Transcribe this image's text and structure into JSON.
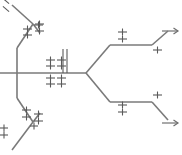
{
  "diagram": {
    "type": "phylogenetic-tree",
    "stroke_color": "#7a7a7a",
    "tick_color": "#5a5a5a",
    "background_color": "#ffffff",
    "width": 182,
    "height": 155,
    "branches": [
      {
        "id": "trunk-horizontal",
        "name": "central-horizontal-trunk",
        "points": "0,73 86,73"
      },
      {
        "id": "left-vertical",
        "name": "left-vertical-connector",
        "points": "17,48 17,98"
      },
      {
        "id": "upper-left-diagonal-in",
        "name": "upper-left-inner-diagonal",
        "points": "17,48 33,24"
      },
      {
        "id": "upper-left-node-upper",
        "name": "upper-left-node-upper-arm",
        "points": "33,24 12,5"
      },
      {
        "id": "upper-left-node-lower",
        "name": "upper-left-node-lower-arm",
        "points": "33,24 40,33"
      },
      {
        "id": "lower-left-diagonal-in",
        "name": "lower-left-inner-diagonal",
        "points": "17,98 33,122"
      },
      {
        "id": "lower-left-node-lower",
        "name": "lower-left-node-lower-arm",
        "points": "33,122 12,150"
      },
      {
        "id": "lower-left-node-upper",
        "name": "lower-left-node-upper-arm",
        "points": "33,122 40,113"
      },
      {
        "id": "right-fork-upper",
        "name": "right-fork-upper-diagonal",
        "points": "86,73 110,45"
      },
      {
        "id": "right-upper-horizontal",
        "name": "right-upper-horizontal",
        "points": "110,45 152,45"
      },
      {
        "id": "right-upper-tip",
        "name": "right-upper-terminal-diagonal",
        "points": "152,45 168,31"
      },
      {
        "id": "right-fork-lower",
        "name": "right-fork-lower-diagonal",
        "points": "86,73 110,102"
      },
      {
        "id": "right-lower-horizontal",
        "name": "right-lower-horizontal",
        "points": "110,102 152,102"
      },
      {
        "id": "right-lower-tip",
        "name": "right-lower-terminal-diagonal",
        "points": "152,102 168,120"
      }
    ],
    "arrows": [
      {
        "id": "arrow-upper-right",
        "name": "upper-right-arrow",
        "x1": 162,
        "y1": 31,
        "x2": 178,
        "y2": 31
      },
      {
        "id": "arrow-lower-right",
        "name": "lower-right-arrow",
        "x1": 162,
        "y1": 123,
        "x2": 178,
        "y2": 123
      }
    ],
    "tick_groups": [
      {
        "id": "ticks-top-left-edge",
        "name": "tick-group-top-left-edge",
        "label": "+",
        "count": 2,
        "ticks": [
          {
            "x": 2,
            "y": 1,
            "angle": 40,
            "len": 8
          },
          {
            "x": 2,
            "y": 9,
            "angle": 40,
            "len": 8
          }
        ]
      },
      {
        "id": "ticks-upper-left-node",
        "name": "tick-group-upper-left-node",
        "label": "+ +",
        "count": 3,
        "ticks": [
          {
            "x": 23,
            "y": 29,
            "angle": 0,
            "len": 9
          },
          {
            "x": 23,
            "y": 35,
            "angle": 0,
            "len": 9
          },
          {
            "x": 34,
            "y": 25,
            "angle": 0,
            "len": 9
          }
        ]
      },
      {
        "id": "ticks-upper-left-outer",
        "name": "tick-group-upper-left-outer",
        "label": "‡",
        "count": 2,
        "ticks": [
          {
            "x": 35,
            "y": 24,
            "angle": 0,
            "len": 9
          },
          {
            "x": 35,
            "y": 31,
            "angle": 0,
            "len": 9
          }
        ]
      },
      {
        "id": "ticks-center-upper-left",
        "name": "tick-group-center-upper-left",
        "label": "‡",
        "count": 2,
        "ticks": [
          {
            "x": 46,
            "y": 60,
            "angle": 0,
            "len": 9
          },
          {
            "x": 46,
            "y": 66,
            "angle": 0,
            "len": 9
          }
        ]
      },
      {
        "id": "ticks-center-upper-right",
        "name": "tick-group-center-upper-right",
        "label": "‡",
        "count": 2,
        "ticks": [
          {
            "x": 57,
            "y": 60,
            "angle": 0,
            "len": 9
          },
          {
            "x": 57,
            "y": 66,
            "angle": 0,
            "len": 9
          }
        ]
      },
      {
        "id": "ticks-center-lower-left",
        "name": "tick-group-center-lower-left",
        "label": "‡",
        "count": 2,
        "ticks": [
          {
            "x": 46,
            "y": 78,
            "angle": 0,
            "len": 9
          },
          {
            "x": 46,
            "y": 84,
            "angle": 0,
            "len": 9
          }
        ]
      },
      {
        "id": "ticks-center-lower-right",
        "name": "tick-group-center-lower-right",
        "label": "‡",
        "count": 2,
        "ticks": [
          {
            "x": 57,
            "y": 78,
            "angle": 0,
            "len": 9
          },
          {
            "x": 57,
            "y": 84,
            "angle": 0,
            "len": 9
          }
        ]
      },
      {
        "id": "ticks-center-vertical-bars",
        "name": "tick-group-center-vertical-bars",
        "label": "vertical-hatch",
        "count": 2,
        "ticks": [
          {
            "x": 51,
            "y": 61,
            "angle": 90,
            "len": 24
          },
          {
            "x": 55,
            "y": 61,
            "angle": 90,
            "len": 24
          }
        ]
      },
      {
        "id": "ticks-right-upper-branch",
        "name": "tick-group-right-upper-branch",
        "label": "‡",
        "count": 2,
        "ticks": [
          {
            "x": 118,
            "y": 32,
            "angle": 0,
            "len": 9
          },
          {
            "x": 118,
            "y": 39,
            "angle": 0,
            "len": 9
          }
        ]
      },
      {
        "id": "ticks-right-upper-tip",
        "name": "tick-group-right-upper-tip",
        "label": "+",
        "count": 1,
        "ticks": [
          {
            "x": 153,
            "y": 50,
            "angle": 0,
            "len": 9
          }
        ]
      },
      {
        "id": "ticks-right-lower-branch",
        "name": "tick-group-right-lower-branch",
        "label": "‡",
        "count": 2,
        "ticks": [
          {
            "x": 118,
            "y": 105,
            "angle": 0,
            "len": 9
          },
          {
            "x": 118,
            "y": 112,
            "angle": 0,
            "len": 9
          }
        ]
      },
      {
        "id": "ticks-right-lower-tip",
        "name": "tick-group-right-lower-tip",
        "label": "+",
        "count": 1,
        "ticks": [
          {
            "x": 153,
            "y": 95,
            "angle": 0,
            "len": 9
          }
        ]
      },
      {
        "id": "ticks-lower-left-node",
        "name": "tick-group-lower-left-node",
        "label": "+ +",
        "count": 2,
        "ticks": [
          {
            "x": 22,
            "y": 110,
            "angle": 0,
            "len": 9
          },
          {
            "x": 22,
            "y": 117,
            "angle": 0,
            "len": 9
          }
        ]
      },
      {
        "id": "ticks-lower-left-outer",
        "name": "tick-group-lower-left-outer",
        "label": "‡",
        "count": 2,
        "ticks": [
          {
            "x": 34,
            "y": 114,
            "angle": 0,
            "len": 9
          },
          {
            "x": 34,
            "y": 121,
            "angle": 0,
            "len": 9
          }
        ]
      },
      {
        "id": "ticks-bottom-left-edge",
        "name": "tick-group-bottom-left-edge",
        "label": "+",
        "count": 2,
        "ticks": [
          {
            "x": 0,
            "y": 128,
            "angle": 0,
            "len": 8
          },
          {
            "x": 0,
            "y": 135,
            "angle": 0,
            "len": 8
          }
        ]
      },
      {
        "id": "ticks-bottom-mid",
        "name": "tick-group-bottom-mid",
        "label": "+",
        "count": 1,
        "ticks": [
          {
            "x": 30,
            "y": 126,
            "angle": 0,
            "len": 8
          }
        ]
      }
    ]
  }
}
